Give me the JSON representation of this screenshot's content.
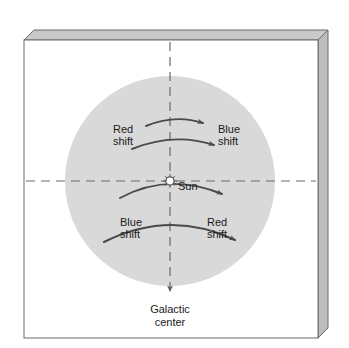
{
  "figure": {
    "type": "astronomy-diagram",
    "colors": {
      "disk_fill": "#d9d9d9",
      "frame_stroke": "#6b6b6b",
      "frame_top_face": "#c9c9c9",
      "frame_right_face": "#bdbdbd",
      "arrow_stroke": "#4a4a4a",
      "dashed_stroke": "#6a6a6a",
      "text": "#1a1a1a",
      "page_background": "#ffffff",
      "sun_fill": "#ffffff",
      "sun_stroke": "#555555"
    },
    "frame": {
      "name": "beveled-3d-panel",
      "depth_px": 10
    },
    "disk": {
      "name": "galactic-disk",
      "center_x": 170,
      "center_y": 181,
      "radius": 105
    },
    "axes": {
      "vertical_dashed": {
        "label_end": "Galactic center",
        "x": 170,
        "y_start": 40,
        "y_end": 296,
        "arrowhead": "down"
      },
      "horizontal_dashed": {
        "y": 181,
        "x_start": 24,
        "x_end": 318,
        "arrowhead": "none"
      }
    },
    "markers": [
      {
        "name": "sun-marker",
        "label": "Sun",
        "x": 170,
        "y": 181,
        "symbol": "starburst-circle"
      }
    ],
    "velocity_arcs": [
      {
        "id": "arc-top-1",
        "quadrant": "upper",
        "direction": "right"
      },
      {
        "id": "arc-top-2",
        "quadrant": "upper",
        "direction": "right"
      },
      {
        "id": "arc-sun",
        "quadrant": "through-sun",
        "direction": "down-right"
      },
      {
        "id": "arc-bottom-1",
        "quadrant": "lower",
        "direction": "down-right"
      }
    ],
    "labels": [
      {
        "name": "label-red-shift-upper-left",
        "line1": "Red",
        "line2": "shift",
        "x": 113,
        "y": 133
      },
      {
        "name": "label-blue-shift-upper-right",
        "line1": "Blue",
        "line2": "shift",
        "x": 218,
        "y": 133
      },
      {
        "name": "label-blue-shift-lower-left",
        "line1": "Blue",
        "line2": "shift",
        "x": 120,
        "y": 226
      },
      {
        "name": "label-red-shift-lower-right",
        "line1": "Red",
        "line2": "shift",
        "x": 207,
        "y": 226
      }
    ],
    "caption": {
      "name": "galactic-center-caption",
      "line1": "Galactic",
      "line2": "center",
      "x": 170,
      "y": 313
    }
  }
}
